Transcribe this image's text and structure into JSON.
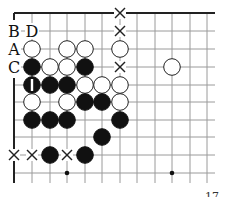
{
  "diagram": {
    "type": "go-board-fragment",
    "grid": {
      "col_x": [
        14,
        32,
        50,
        67,
        85,
        102,
        120,
        137,
        155,
        172,
        190,
        207
      ],
      "row_y": [
        13,
        31,
        49,
        67,
        85,
        102,
        120,
        137,
        155,
        173
      ],
      "right_end_x": 215,
      "bottom_end_y": 183,
      "line_color": "#9a9a9a",
      "edge_color": "#222222"
    },
    "edges": {
      "top": {
        "y": 13,
        "x1": 14,
        "x2": 215
      },
      "left": {
        "x": 14,
        "y1": 78,
        "y2": 183
      },
      "left_tick": {
        "x1": 14,
        "x2": 20,
        "y": 13,
        "y2": 20
      }
    },
    "stone_radius": 8.3,
    "stones": [
      {
        "color": "white",
        "col": 1,
        "row": 2
      },
      {
        "color": "white",
        "col": 3,
        "row": 2
      },
      {
        "color": "white",
        "col": 4,
        "row": 2
      },
      {
        "color": "white",
        "col": 6,
        "row": 2
      },
      {
        "color": "black",
        "col": 1,
        "row": 3
      },
      {
        "color": "white",
        "col": 2,
        "row": 3
      },
      {
        "color": "white",
        "col": 3,
        "row": 3
      },
      {
        "color": "black",
        "col": 4,
        "row": 3
      },
      {
        "color": "white",
        "col": 9,
        "row": 3
      },
      {
        "color": "black",
        "col": 1,
        "row": 4,
        "mark": "1"
      },
      {
        "color": "black",
        "col": 2,
        "row": 4
      },
      {
        "color": "black",
        "col": 3,
        "row": 4
      },
      {
        "color": "white",
        "col": 4,
        "row": 4
      },
      {
        "color": "white",
        "col": 5,
        "row": 4
      },
      {
        "color": "white",
        "col": 6,
        "row": 4
      },
      {
        "color": "white",
        "col": 1,
        "row": 5
      },
      {
        "color": "white",
        "col": 3,
        "row": 5
      },
      {
        "color": "black",
        "col": 4,
        "row": 5
      },
      {
        "color": "black",
        "col": 5,
        "row": 5
      },
      {
        "color": "white",
        "col": 6,
        "row": 5
      },
      {
        "color": "black",
        "col": 1,
        "row": 6
      },
      {
        "color": "black",
        "col": 2,
        "row": 6
      },
      {
        "color": "black",
        "col": 3,
        "row": 6
      },
      {
        "color": "black",
        "col": 6,
        "row": 6
      },
      {
        "color": "black",
        "col": 5,
        "row": 7
      },
      {
        "color": "black",
        "col": 2,
        "row": 8
      },
      {
        "color": "black",
        "col": 4,
        "row": 8
      }
    ],
    "cross_marks": [
      {
        "col": 6,
        "row": 0
      },
      {
        "col": 6,
        "row": 1
      },
      {
        "col": 6,
        "row": 3
      },
      {
        "col": 0,
        "row": 8
      },
      {
        "col": 1,
        "row": 8
      },
      {
        "col": 3,
        "row": 8
      }
    ],
    "star_points": [
      {
        "col": 3,
        "row": 9
      },
      {
        "col": 9,
        "row": 9
      }
    ],
    "letter_labels": [
      {
        "text": "B",
        "col": 0,
        "row": 1
      },
      {
        "text": "D",
        "col": 1,
        "row": 1
      },
      {
        "text": "A",
        "col": 0,
        "row": 2
      },
      {
        "text": "C",
        "col": 0,
        "row": 3
      }
    ],
    "footer_fragment": "17"
  }
}
